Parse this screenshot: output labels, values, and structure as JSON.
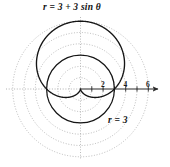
{
  "figure": {
    "title": "",
    "background_color": "#ffffff",
    "curve_color": "#151515",
    "grid_color": "#9a9a9a",
    "axis_color": "#2a2a2a",
    "labels": {
      "cardioid": "r = 3 + 3 sin θ",
      "circle": "r = 3"
    }
  },
  "chart_data": {
    "type": "line",
    "plot_kind": "polar",
    "title": "",
    "subtitle": "",
    "xlabel": "",
    "ylabel": "",
    "grid": true,
    "grid_style": "dotted concentric circles at r = 1,2,3,4,5,6 with dotted horizontal and vertical axes",
    "legend": "inline annotations",
    "axis": {
      "polar_axis_visible": true,
      "arrow_at_right_end": true,
      "tick_labels": [
        "2",
        "4",
        "6"
      ],
      "tick_values": [
        2,
        4,
        6
      ],
      "minor_ticks": [
        1,
        2,
        3,
        4,
        5,
        6
      ],
      "xlim": [
        -6,
        7
      ],
      "ylim": [
        -6.5,
        6.5
      ],
      "units_per_tick": 1
    },
    "series": [
      {
        "name": "r = 3 + 3 sin θ",
        "equation": "r = 3 + 3*sin(theta)",
        "curve_type": "cardioid",
        "label": "r = 3 + 3 sin θ",
        "label_position": "top",
        "max_r": 6,
        "min_r": 0,
        "cusp_at": "origin (theta = -pi/2)",
        "stroke": "#151515",
        "stroke_width": 1.2,
        "points_r_by_theta_deg": {
          "0": 3,
          "30": 4.5,
          "60": 5.6,
          "90": 6,
          "120": 5.6,
          "150": 4.5,
          "180": 3,
          "210": 1.5,
          "240": 0.4,
          "270": 0,
          "300": 0.4,
          "330": 1.5
        }
      },
      {
        "name": "r = 3",
        "equation": "r = 3",
        "curve_type": "circle",
        "label": "r = 3",
        "label_position": "lower-right",
        "radius": 3,
        "center": [
          0,
          0
        ],
        "stroke": "#151515",
        "stroke_width": 1.2
      }
    ],
    "grid_circles": [
      {
        "r": 1
      },
      {
        "r": 2
      },
      {
        "r": 3
      },
      {
        "r": 4
      },
      {
        "r": 5
      },
      {
        "r": 6
      }
    ],
    "intersections": [
      {
        "theta_deg": 0,
        "r": 3
      },
      {
        "theta_deg": 180,
        "r": 3
      }
    ]
  }
}
